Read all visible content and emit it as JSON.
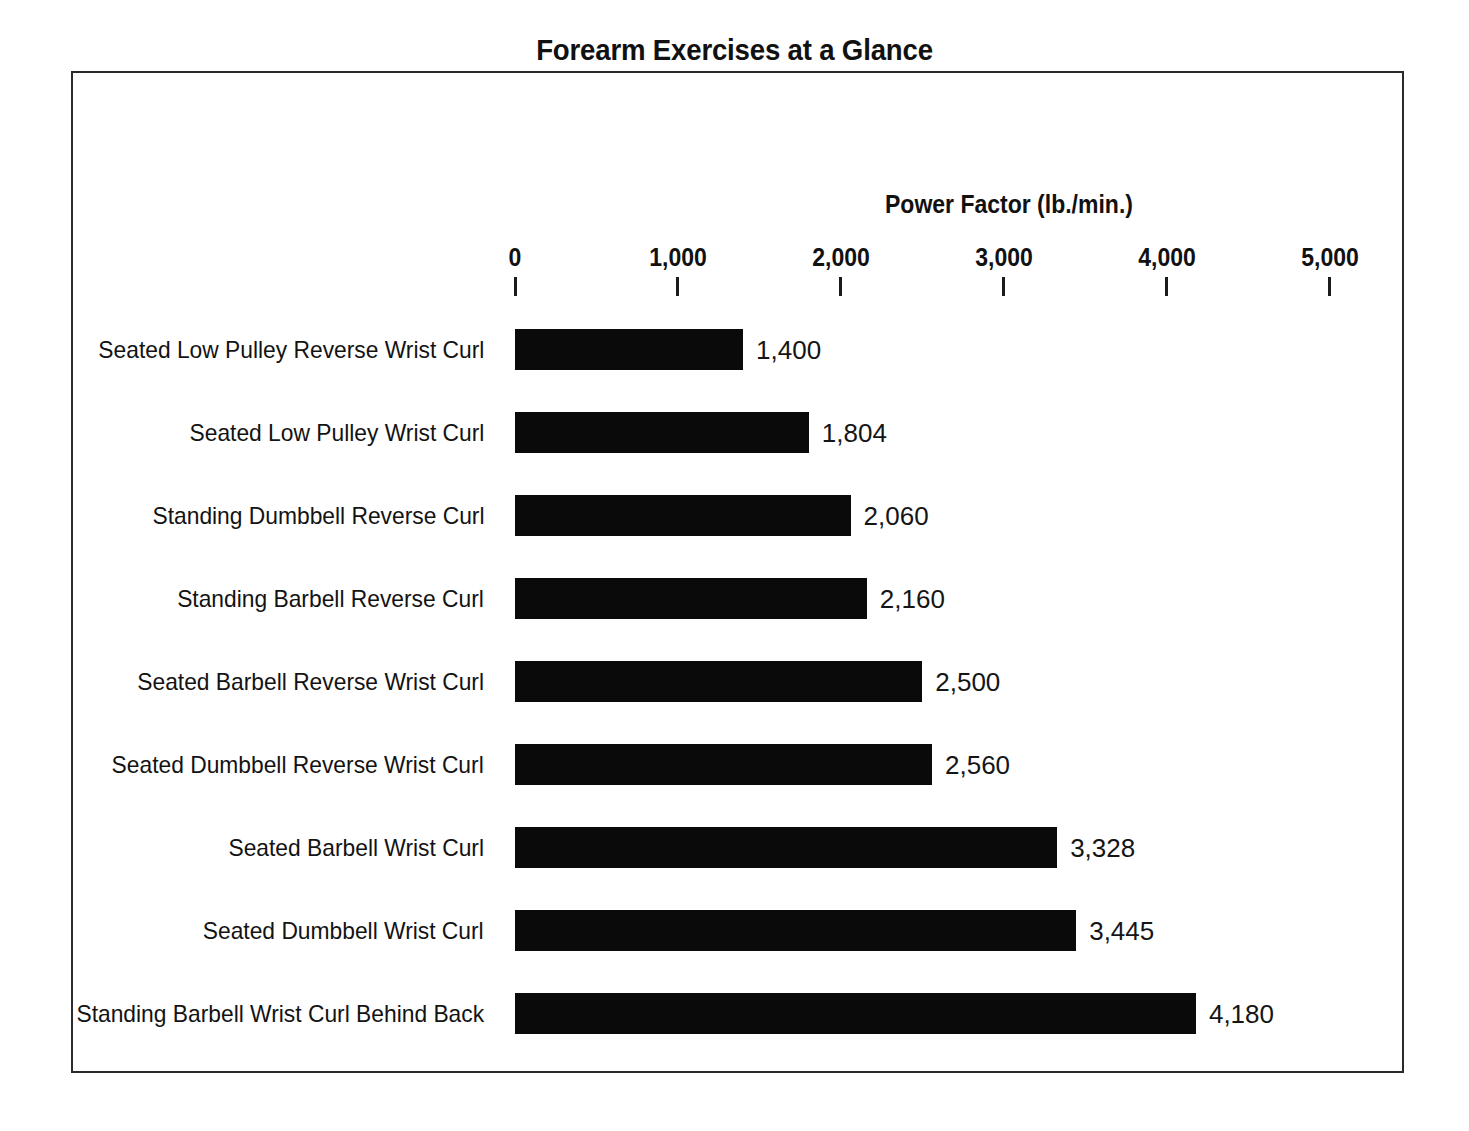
{
  "chart_data": {
    "type": "bar",
    "orientation": "horizontal",
    "title": "Forearm Exercises at a Glance",
    "xlabel": "Power Factor (lb./min.)",
    "ylabel": "",
    "xlim": [
      0,
      5000
    ],
    "grid": false,
    "legend": null,
    "xticks": [
      "0",
      "1,000",
      "2,000",
      "3,000",
      "4,000",
      "5,000"
    ],
    "xtick_values": [
      0,
      1000,
      2000,
      3000,
      4000,
      5000
    ],
    "bar_color": "#0a0a0a",
    "categories": [
      "Seated Low Pulley Reverse Wrist Curl",
      "Seated Low Pulley Wrist Curl",
      "Standing Dumbbell Reverse Curl",
      "Standing Barbell Reverse Curl",
      "Seated Barbell Reverse Wrist Curl",
      "Seated Dumbbell Reverse Wrist Curl",
      "Seated Barbell Wrist Curl",
      "Seated Dumbbell Wrist Curl",
      "Standing Barbell Wrist Curl Behind Back"
    ],
    "values": [
      1400,
      1804,
      2060,
      2160,
      2500,
      2560,
      3328,
      3445,
      4180
    ],
    "value_labels": [
      "1,400",
      "1,804",
      "2,060",
      "2,160",
      "2,500",
      "2,560",
      "3,328",
      "3,445",
      "4,180"
    ]
  }
}
